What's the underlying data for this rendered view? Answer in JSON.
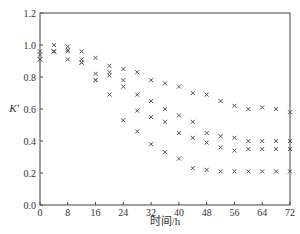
{
  "chart_data": {
    "type": "scatter",
    "title": "",
    "xlabel": "时间/h",
    "ylabel": "K'",
    "xlim": [
      0,
      72
    ],
    "ylim": [
      0.0,
      1.2
    ],
    "xticks": [
      0,
      8,
      16,
      24,
      32,
      40,
      48,
      56,
      64,
      72
    ],
    "yticks": [
      "0.0",
      "0.2",
      "0.4",
      "0.6",
      "0.8",
      "1.0",
      "1.2"
    ],
    "grid": false,
    "legend": null,
    "marker": "x",
    "x": [
      0,
      4,
      8,
      12,
      16,
      20,
      24,
      28,
      32,
      36,
      40,
      44,
      48,
      52,
      56,
      60,
      64,
      68,
      72
    ],
    "series": [
      {
        "name": "series-1",
        "values": [
          0.96,
          1.0,
          0.99,
          0.96,
          0.92,
          0.87,
          0.85,
          0.83,
          0.78,
          0.76,
          0.74,
          0.7,
          0.69,
          0.65,
          0.62,
          0.6,
          0.61,
          0.6,
          0.58
        ]
      },
      {
        "name": "series-2",
        "values": [
          0.94,
          0.96,
          0.97,
          0.91,
          0.82,
          0.83,
          0.78,
          0.69,
          0.65,
          0.6,
          0.56,
          0.52,
          0.45,
          0.43,
          0.42,
          0.4,
          0.4,
          0.4,
          0.4
        ]
      },
      {
        "name": "series-3",
        "values": [
          0.91,
          0.96,
          0.96,
          0.89,
          0.78,
          0.81,
          0.74,
          0.59,
          0.55,
          0.52,
          0.45,
          0.42,
          0.39,
          0.36,
          0.34,
          0.35,
          0.35,
          0.35,
          0.35
        ]
      },
      {
        "name": "series-4",
        "values": [
          0.91,
          0.96,
          0.91,
          0.89,
          0.78,
          0.69,
          0.53,
          0.46,
          0.38,
          0.33,
          0.29,
          0.23,
          0.22,
          0.21,
          0.21,
          0.21,
          0.21,
          0.21,
          0.21
        ]
      }
    ]
  },
  "axes": {
    "x_title": "时间/h",
    "y_title": "K'"
  }
}
